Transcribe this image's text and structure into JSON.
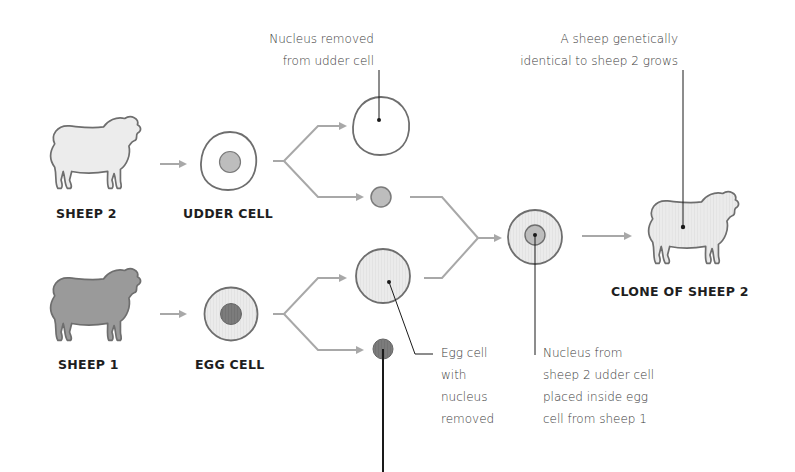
{
  "labels": {
    "sheep2": "SHEEP 2",
    "udder_cell": "UDDER CELL",
    "sheep1": "SHEEP 1",
    "egg_cell": "EGG CELL",
    "clone": "CLONE OF SHEEP 2"
  },
  "notes": {
    "nucleus_removed": [
      "Nucleus removed",
      "from udder cell"
    ],
    "genetically_identical": [
      "A sheep genetically",
      "identical to sheep 2 grows"
    ],
    "egg_no_nucleus": [
      "Egg cell",
      "with",
      "nucleus",
      "removed"
    ],
    "nucleus_placed": [
      "Nucleus from",
      "sheep 2 udder cell",
      "placed inside egg",
      "cell from sheep 1"
    ]
  },
  "colors": {
    "arrow": "#a8a8a8",
    "outline": "#6e6e6e",
    "light_fill": "#ececec",
    "nucleus_light": "#bdbdbd",
    "nucleus_dark": "#7a7a7a",
    "sheep1_fill": "#9a9a9a",
    "leader": "#1a1a1a"
  }
}
